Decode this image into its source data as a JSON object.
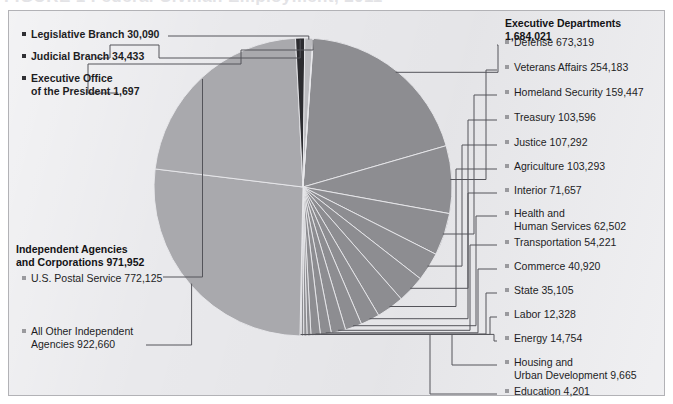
{
  "figure": {
    "title_fragment": "FIGURE 1  Federal Civilian Employment, 2011",
    "panel_bg": "#e9e9ec",
    "panel_border": "#b2b2b6"
  },
  "colors": {
    "executive_departments": "#8d8d91",
    "independent_agencies": "#a9a9ad",
    "judicial_branch": "#2c2c30",
    "legislative_branch": "#bcbcc0",
    "executive_office": "#cfcfd3",
    "slice_divider": "#e9e9ec",
    "leader_line": "#54545a",
    "bullet_light": "#9a9a9e",
    "bullet_dark": "#303034",
    "text": "#1d1d1f"
  },
  "groups": {
    "executive_departments": {
      "label": "Executive Departments",
      "value": "1,684,021"
    },
    "independent_agencies": {
      "label": "Independent Agencies",
      "label_line2": "and Corporations 971,952",
      "value": "971,952"
    }
  },
  "left_labels": [
    {
      "name": "legislative-branch",
      "text": "Legislative Branch  30,090",
      "bold": true
    },
    {
      "name": "judicial-branch",
      "text": "Judicial Branch  34,433",
      "bold": true
    },
    {
      "name": "executive-office",
      "text": "Executive Office",
      "text2": "of the President  1,697",
      "bold": true
    },
    {
      "name": "us-postal-service",
      "text": "U.S. Postal Service  772,125",
      "bold": false
    },
    {
      "name": "all-other-independent-agencies",
      "text": "All Other Independent",
      "text2": "Agencies  922,660",
      "bold": false
    }
  ],
  "right_labels": [
    {
      "name": "defense",
      "text": "Defense  673,319"
    },
    {
      "name": "veterans-affairs",
      "text": "Veterans Affairs  254,183"
    },
    {
      "name": "homeland-security",
      "text": "Homeland Security  159,447"
    },
    {
      "name": "treasury",
      "text": "Treasury  103,596"
    },
    {
      "name": "justice",
      "text": "Justice  107,292"
    },
    {
      "name": "agriculture",
      "text": "Agriculture  103,293"
    },
    {
      "name": "interior",
      "text": "Interior  71,657"
    },
    {
      "name": "health-and-human-services",
      "text": "Health and",
      "text2": "Human Services  62,502"
    },
    {
      "name": "transportation",
      "text": "Transportation  54,221"
    },
    {
      "name": "commerce",
      "text": "Commerce  40,920"
    },
    {
      "name": "state",
      "text": "State  35,105"
    },
    {
      "name": "labor",
      "text": "Labor  12,328"
    },
    {
      "name": "energy",
      "text": "Energy  14,754"
    },
    {
      "name": "housing-and-urban-development",
      "text": "Housing and",
      "text2": "Urban Development  9,665"
    },
    {
      "name": "education",
      "text": "Education  4,201"
    }
  ],
  "chart_data": {
    "type": "pie",
    "title": "Federal Civilian Employment",
    "unit": "employees",
    "center": [
      303,
      187
    ],
    "radius": 149,
    "start_angle_deg": -86,
    "direction": "clockwise",
    "legend_position": "callout-leader-lines",
    "grid": false,
    "categories": [
      "Defense",
      "Veterans Affairs",
      "Homeland Security",
      "Justice",
      "Treasury",
      "Agriculture",
      "Interior",
      "Health and Human Services",
      "Transportation",
      "Commerce",
      "State",
      "Energy",
      "Labor",
      "Housing and Urban Development",
      "Education",
      "All Other Independent Agencies",
      "U.S. Postal Service",
      "Judicial Branch",
      "Legislative Branch",
      "Executive Office of the President"
    ],
    "values": [
      673319,
      254183,
      159447,
      107292,
      103596,
      103293,
      71657,
      62502,
      54221,
      40920,
      35105,
      14754,
      12328,
      9665,
      4201,
      922660,
      772125,
      34433,
      30090,
      1697
    ],
    "group_of": [
      "Executive Departments",
      "Executive Departments",
      "Executive Departments",
      "Executive Departments",
      "Executive Departments",
      "Executive Departments",
      "Executive Departments",
      "Executive Departments",
      "Executive Departments",
      "Executive Departments",
      "Executive Departments",
      "Executive Departments",
      "Executive Departments",
      "Executive Departments",
      "Executive Departments",
      "Independent Agencies and Corporations",
      "Independent Agencies and Corporations",
      "Judicial Branch",
      "Legislative Branch",
      "Executive Office of the President"
    ],
    "group_totals": {
      "Executive Departments": 1684021,
      "Independent Agencies and Corporations": 971952,
      "Judicial Branch": 34433,
      "Legislative Branch": 30090,
      "Executive Office of the President": 1697
    },
    "total": 2724193
  }
}
